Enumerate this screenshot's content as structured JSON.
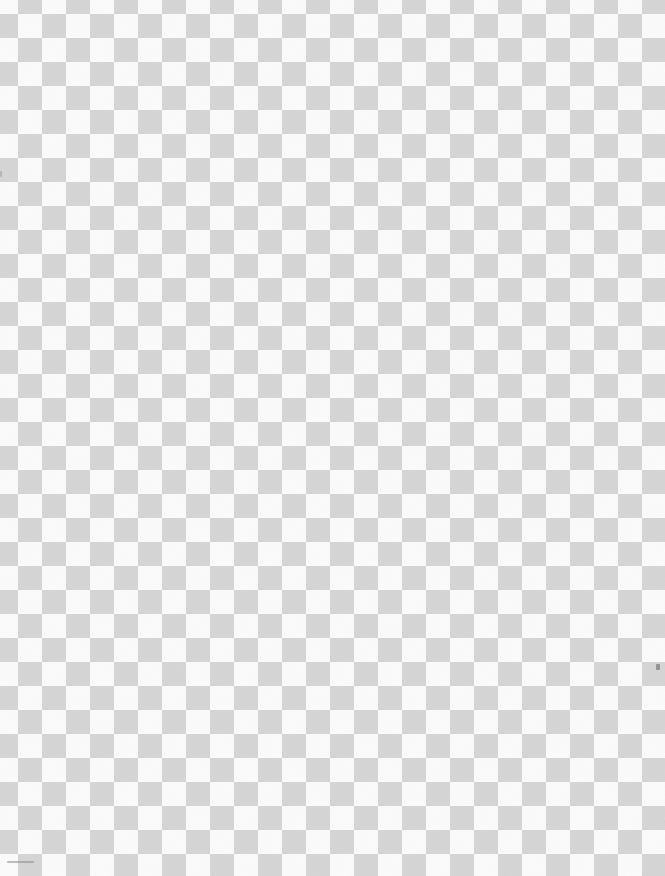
{
  "canvas": {
    "description": "transparency-checkerboard-pattern",
    "square_size_px": 24,
    "colors": {
      "dark": "#d5d5d5",
      "light": "#fbfbfb"
    },
    "offset": {
      "x": -6,
      "y": -10
    },
    "artifacts": [
      {
        "name": "bottom-left-smudge-mark",
        "x": 7,
        "y": 861,
        "width": 27,
        "height": 2,
        "color": "#8a8a8a"
      },
      {
        "name": "lower-right-speck-mark",
        "x": 656,
        "y": 664,
        "width": 4,
        "height": 6,
        "color": "#5f5f5f"
      },
      {
        "name": "left-edge-speck-mark",
        "x": 0,
        "y": 171,
        "width": 2,
        "height": 6,
        "color": "#9a9a9a"
      }
    ]
  }
}
